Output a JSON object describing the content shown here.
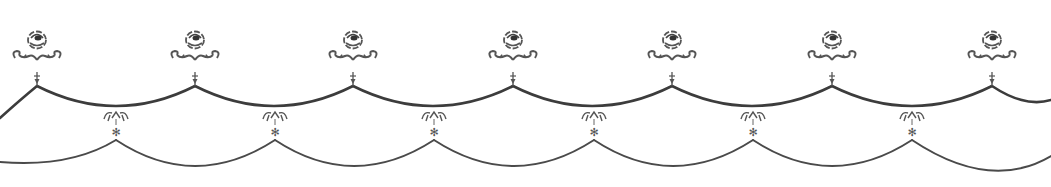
{
  "image": {
    "kind": "decorative-border",
    "description": "Repeating ornamental swag border with roses and scroll ornaments",
    "width": 1051,
    "height": 187,
    "background": "#ffffff",
    "ink_color": "#4a4a4a"
  },
  "ornaments": {
    "rose_x": [
      37,
      195,
      353,
      513,
      672,
      832,
      992
    ],
    "rose_y": 40,
    "upper_swag": {
      "peak_y": 86,
      "dip_y": 106
    },
    "lower_peaks_x": [
      116,
      275,
      434,
      594,
      753,
      912
    ],
    "lower_swag": {
      "peak_y": 140,
      "dip_y": 166
    }
  }
}
